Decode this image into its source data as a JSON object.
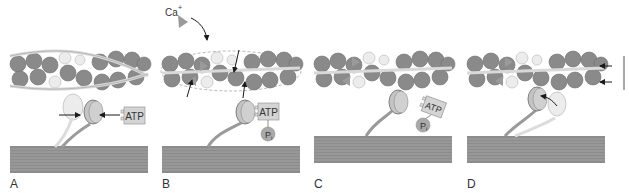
{
  "figure": {
    "panels": [
      {
        "label": "A",
        "atp_label": "ATP"
      },
      {
        "label": "B",
        "ion_label": "Ca",
        "ion_charge": "+",
        "atp_label": "ATP",
        "phosphate_label": "P",
        "phosphate_sub": "i"
      },
      {
        "label": "C",
        "atp_label": "ATP",
        "phosphate_label": "P",
        "phosphate_sub": "i"
      },
      {
        "label": "D"
      }
    ],
    "colors": {
      "actin_bead": "#8a8a8a",
      "actin_bead_light": "#e6e6e6",
      "tropomyosin": "#d9d9d9",
      "myosin_head": "#bdbdbd",
      "myosin_head_light": "#ececec",
      "thick_filament": "#8c8c8c",
      "thick_filament_line": "#a8a8a8",
      "atp_box": "#d4d4d4",
      "phosphate": "#a9a9a9",
      "arrow": "#1a1a1a"
    }
  }
}
